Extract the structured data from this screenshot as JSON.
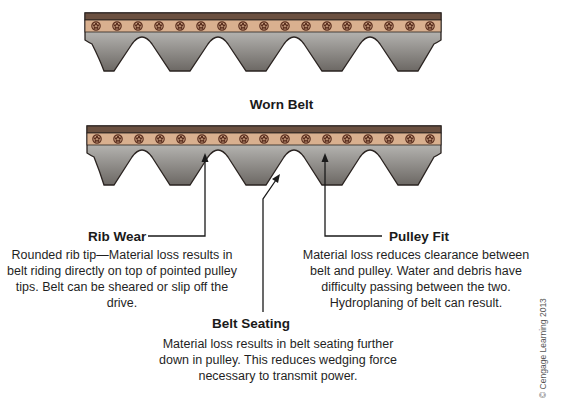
{
  "diagram": {
    "title": "Worn Belt",
    "callouts": {
      "rib_wear": {
        "heading": "Rib Wear",
        "text": "Rounded rib tip—Material loss results in belt riding directly on top of pointed pulley tips. Belt can be sheared or slip off the drive."
      },
      "pulley_fit": {
        "heading": "Pulley Fit",
        "text": "Material loss reduces clearance between belt and pulley. Water and debris have difficulty passing between the two. Hydroplaning of belt can result."
      },
      "belt_seating": {
        "heading": "Belt Seating",
        "text": "Material loss results in belt seating further down in pulley. This reduces wedging force necessary to transmit power."
      }
    },
    "credit": "© Cengage Learning 2013",
    "colors": {
      "backing": "#6b5040",
      "cord_band": "#d9b08f",
      "cord": "#5a2e1e",
      "rib_top": "#cfcfcc",
      "rib_bottom": "#6e6a66",
      "outline": "#2a2320"
    }
  }
}
